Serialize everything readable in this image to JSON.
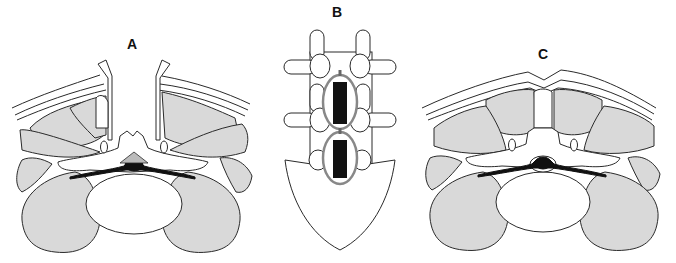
{
  "figure": {
    "panels": [
      {
        "id": "A",
        "label": "A",
        "view": "axial cross-section, spinous process removed, paraspinal muscles retracted"
      },
      {
        "id": "B",
        "label": "B",
        "view": "posterior view of lumbar vertebrae and sacrum with laminectomy windows"
      },
      {
        "id": "C",
        "label": "C",
        "view": "axial cross-section, midline structures preserved"
      }
    ],
    "colors": {
      "muscle_fill": "#d9d9d9",
      "outline": "#2a2a2a",
      "neural_fill": "#111111",
      "background": "#ffffff"
    }
  }
}
